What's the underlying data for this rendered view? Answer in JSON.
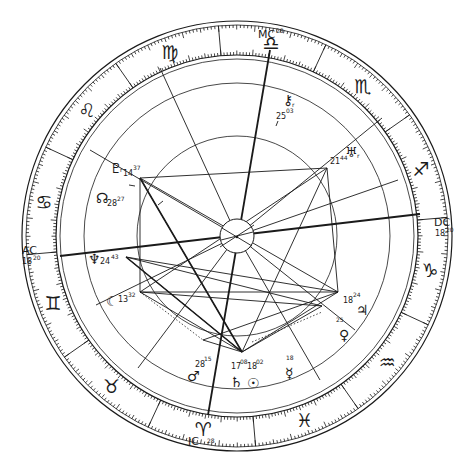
{
  "chart": {
    "type": "natal-astrology-wheel",
    "center": [
      237,
      236
    ],
    "radii": {
      "outer": 215,
      "outer_inner": 211,
      "zodiac_inner": 181,
      "zodiac_inner2": 177,
      "house": 152,
      "aspect": 100,
      "hub": 17
    },
    "colors": {
      "ink": "#1a1a1a",
      "background": "#ffffff"
    }
  },
  "angles": {
    "mc": {
      "label": "MC",
      "degree": "28"
    },
    "ic": {
      "label": "IC",
      "degree": "28"
    },
    "asc": {
      "label": "AC",
      "degree": "18",
      "minute": "20"
    },
    "dsc": {
      "label": "DC",
      "degree": "18",
      "minute": "20"
    }
  },
  "signs": [
    {
      "name": "taurus",
      "glyph": "♉"
    },
    {
      "name": "aries",
      "glyph": "♈"
    },
    {
      "name": "pisces",
      "glyph": "♓"
    },
    {
      "name": "aquarius",
      "glyph": "♒"
    },
    {
      "name": "capricorn",
      "glyph": "♑"
    },
    {
      "name": "sagittarius",
      "glyph": "♐"
    },
    {
      "name": "scorpio",
      "glyph": "♏"
    },
    {
      "name": "libra",
      "glyph": "♎"
    },
    {
      "name": "virgo",
      "glyph": "♍"
    },
    {
      "name": "leo",
      "glyph": "♌"
    },
    {
      "name": "cancer",
      "glyph": "♋"
    },
    {
      "name": "gemini",
      "glyph": "♊"
    }
  ],
  "planets": [
    {
      "name": "pluto",
      "glyph": "♇",
      "deg": "14",
      "min": "37",
      "retro": "r"
    },
    {
      "name": "north-node",
      "glyph": "☊",
      "deg": "28",
      "min": "27"
    },
    {
      "name": "neptune",
      "glyph": "♆",
      "deg": "24",
      "min": "43"
    },
    {
      "name": "moon",
      "glyph": "☾",
      "deg": "13",
      "min": "32"
    },
    {
      "name": "mars",
      "glyph": "♂",
      "deg": "28",
      "min": "15"
    },
    {
      "name": "saturn",
      "glyph": "♄",
      "deg": "17",
      "min": "08"
    },
    {
      "name": "sun",
      "glyph": "☉",
      "deg": "18",
      "min": "02"
    },
    {
      "name": "mercury",
      "glyph": "☿",
      "deg": "",
      "min": "18"
    },
    {
      "name": "venus",
      "glyph": "♀",
      "deg": "",
      "min": "25"
    },
    {
      "name": "jupiter",
      "glyph": "♃",
      "deg": "18",
      "min": "24"
    },
    {
      "name": "uranus",
      "glyph": "♅",
      "deg": "21",
      "min": "44",
      "retro": "r"
    },
    {
      "name": "chiron",
      "glyph": "⚷",
      "deg": "25",
      "min": "03",
      "retro": "r"
    }
  ]
}
